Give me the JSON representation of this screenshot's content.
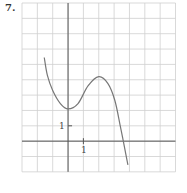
{
  "problem": {
    "number": "7."
  },
  "colors": {
    "grid": "#cfcfcf",
    "axis": "#555555",
    "curve": "#777777"
  },
  "chart_data": {
    "type": "line",
    "title": "",
    "xlabel": "",
    "ylabel": "",
    "xlim": [
      -3,
      7
    ],
    "ylim": [
      -2,
      9
    ],
    "grid": true,
    "tick_labels": {
      "x": [
        "1"
      ],
      "y": [
        "1"
      ]
    },
    "series": [
      {
        "name": "f(x)",
        "x": [
          -1.55,
          -1.35,
          -1.0,
          -0.5,
          0.0,
          0.65,
          1.3,
          2.0,
          2.6,
          3.05,
          3.4,
          3.6,
          3.9
        ],
        "y": [
          5.45,
          4.3,
          3.3,
          2.45,
          2.1,
          2.45,
          3.6,
          4.2,
          3.75,
          2.65,
          1.0,
          0.0,
          -1.55
        ]
      }
    ],
    "annotations": [
      {
        "text": "local min",
        "x": 0,
        "y": 2
      },
      {
        "text": "local max",
        "x": 2,
        "y": 4
      }
    ]
  }
}
